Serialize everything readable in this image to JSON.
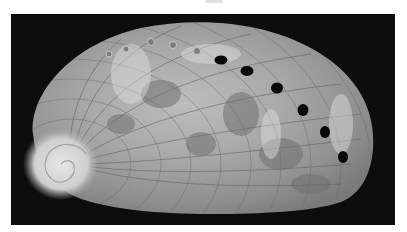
{
  "image": {
    "subject": "abalone shell",
    "description": "Grayscale photograph of an abalone shell viewed from above on a black background, showing a spiral apex on the left and a curved row of respiratory holes along the upper right margin.",
    "colors": {
      "page_background": "#ffffff",
      "photo_background": "#0d0d0d",
      "shell_light": "#d8d8d8",
      "shell_mid": "#9a9a9a",
      "shell_dark": "#5e5e5e",
      "hole": "#080808"
    },
    "open_holes": [
      {
        "cx": 210,
        "cy": 46,
        "rx": 6.5,
        "ry": 4.5
      },
      {
        "cx": 236,
        "cy": 57,
        "rx": 6.5,
        "ry": 5
      },
      {
        "cx": 266,
        "cy": 74,
        "rx": 6,
        "ry": 5.5
      },
      {
        "cx": 292,
        "cy": 96,
        "rx": 5.5,
        "ry": 6
      },
      {
        "cx": 314,
        "cy": 118,
        "rx": 5,
        "ry": 6
      },
      {
        "cx": 332,
        "cy": 143,
        "rx": 5,
        "ry": 6
      }
    ],
    "closed_holes": [
      {
        "cx": 140,
        "cy": 28
      },
      {
        "cx": 162,
        "cy": 31
      },
      {
        "cx": 186,
        "cy": 37
      },
      {
        "cx": 115,
        "cy": 35
      },
      {
        "cx": 98,
        "cy": 40
      }
    ]
  }
}
